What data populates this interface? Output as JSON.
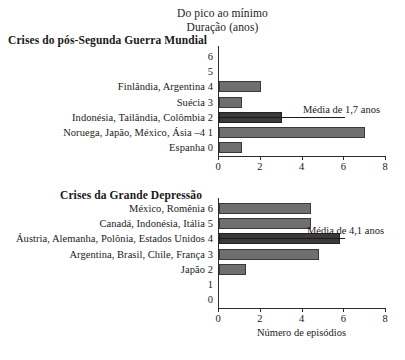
{
  "header": {
    "line1": "Do pico ao mínimo",
    "line2": "Duração (anos)"
  },
  "panels": {
    "top": {
      "title": "Crises do pós-Segunda Guerra Mundial",
      "average_label": "Média de 1,7 anos",
      "average_value": 1.7,
      "yticks": [
        "6",
        "5",
        "4",
        "3",
        "2",
        "1",
        "0"
      ],
      "rows": [
        {
          "ytick": "6",
          "label": "",
          "value": 0
        },
        {
          "ytick": "5",
          "label": "",
          "value": 0
        },
        {
          "ytick": "4",
          "label": "Finlândia, Argentina",
          "value": 2
        },
        {
          "ytick": "3",
          "label": "Suécia",
          "value": 1.1
        },
        {
          "ytick": "2",
          "label": "Indonésia, Tailândia, Colômbia",
          "value": 3
        },
        {
          "ytick": "1",
          "label": "Noruega, Japão, México, Ásia –4",
          "value": 7
        },
        {
          "ytick": "0",
          "label": "Espanha",
          "value": 1.1
        }
      ]
    },
    "bottom": {
      "title": "Crises da Grande Depressão",
      "average_label": "Média de 4,1 anos",
      "average_value": 4.1,
      "yticks": [
        "6",
        "5",
        "4",
        "3",
        "2",
        "1",
        "0"
      ],
      "rows": [
        {
          "ytick": "6",
          "label": "México, Romênia",
          "value": 4.4
        },
        {
          "ytick": "5",
          "label": "Canadá, Indonésia, Itália",
          "value": 4.4
        },
        {
          "ytick": "4",
          "label": "Áustria, Alemanha, Polônia, Estados Unidos",
          "value": 5.8
        },
        {
          "ytick": "3",
          "label": "Argentina, Brasil, Chile, França",
          "value": 4.8
        },
        {
          "ytick": "2",
          "label": "Japão",
          "value": 1.3
        },
        {
          "ytick": "1",
          "label": "",
          "value": 0
        },
        {
          "ytick": "0",
          "label": "",
          "value": 0
        }
      ]
    }
  },
  "axis": {
    "xticks": [
      "0",
      "2",
      "4",
      "6",
      "8"
    ],
    "xtitle": "Número de episódios",
    "xmin": 0,
    "xmax": 8
  },
  "colors": {
    "bar_fill": "#6f6f6f",
    "bar_fill_dark": "#3c3a38",
    "axis": "#2b2b2b",
    "text": "#1a1a1a"
  },
  "chart_data": [
    {
      "type": "bar",
      "orientation": "horizontal",
      "title": "Crises do pós-Segunda Guerra Mundial",
      "subtitle": "Do pico ao mínimo — Duração (anos)",
      "categories": [
        "Finlândia, Argentina",
        "Suécia",
        "Indonésia, Tailândia, Colômbia",
        "Noruega, Japão, México, Ásia –4",
        "Espanha"
      ],
      "category_index": [
        4,
        3,
        2,
        1,
        0
      ],
      "values": [
        2,
        1,
        3,
        7,
        1
      ],
      "xlabel": "Número de episódios",
      "ylabel": "Duração (anos)",
      "xlim": [
        0,
        8
      ],
      "ylim": [
        0,
        6
      ],
      "grid": false,
      "annotations": [
        {
          "text": "Média de 1,7 anos",
          "value": 1.7,
          "at_category": "Indonésia, Tailândia, Colômbia"
        }
      ]
    },
    {
      "type": "bar",
      "orientation": "horizontal",
      "title": "Crises da Grande Depressão",
      "subtitle": "Do pico ao mínimo — Duração (anos)",
      "categories": [
        "México, Romênia",
        "Canadá, Indonésia, Itália",
        "Áustria, Alemanha, Polônia, Estados Unidos",
        "Argentina, Brasil, Chile, França",
        "Japão"
      ],
      "category_index": [
        6,
        5,
        4,
        3,
        2
      ],
      "values": [
        4.4,
        4.4,
        5.8,
        4.8,
        1.3
      ],
      "xlabel": "Número de episódios",
      "ylabel": "Duração (anos)",
      "xlim": [
        0,
        8
      ],
      "ylim": [
        0,
        6
      ],
      "grid": false,
      "annotations": [
        {
          "text": "Média de 4,1 anos",
          "value": 4.1,
          "at_category": "Áustria, Alemanha, Polônia, Estados Unidos"
        }
      ]
    }
  ]
}
